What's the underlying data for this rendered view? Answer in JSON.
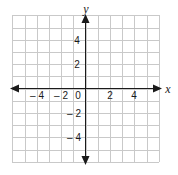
{
  "chart_data": {
    "type": "line",
    "title": "",
    "subtitle": "",
    "xlabel": "x",
    "ylabel": "y",
    "xlim": [
      -6,
      6
    ],
    "ylim": [
      -6,
      6
    ],
    "grid": true,
    "grid_step": 1,
    "legend": "none",
    "series": [],
    "annotations": [],
    "origin_label": "0",
    "x_tick_labels": [
      {
        "value": -4,
        "text": "– 4"
      },
      {
        "value": -2,
        "text": "– 2"
      },
      {
        "value": 2,
        "text": "2"
      },
      {
        "value": 4,
        "text": "4"
      }
    ],
    "y_tick_labels": [
      {
        "value": 4,
        "text": "4"
      },
      {
        "value": 2,
        "text": "2"
      },
      {
        "value": -2,
        "text": "– 2"
      },
      {
        "value": -4,
        "text": "– 4"
      }
    ],
    "colors": {
      "background": "#ffffff",
      "grid": "#c9c9c9",
      "axis": "#1a1a1a",
      "text": "#1a1a1a"
    }
  }
}
